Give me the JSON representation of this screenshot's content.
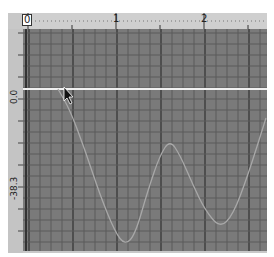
{
  "window": {
    "type": "waveform-plot"
  },
  "top_ruler": {
    "labels": [
      "0",
      "1",
      "2"
    ]
  },
  "left_ruler": {
    "labels": [
      "0.0",
      "-38.3"
    ]
  },
  "colors": {
    "plot_bg": "#7a7a7a",
    "grid_minor": "#5a5a5a",
    "grid_major": "#3c3c3c",
    "waveform": "#a8a8a8",
    "cursor_line": "#f0f0f0",
    "ruler_bg": "#cfcfcf"
  },
  "cursor": {
    "icon": "mouse-pointer-icon"
  },
  "chart_data": {
    "type": "line",
    "title": "",
    "xlabel": "",
    "ylabel": "",
    "x_ticks": [
      0,
      1,
      2
    ],
    "y_ticks": [
      0.0,
      -38.3
    ],
    "xlim": [
      0,
      2.7
    ],
    "ylim": [
      -80,
      30
    ],
    "reference_line_y": 0.0,
    "series": [
      {
        "name": "waveform",
        "x": [
          0.34,
          0.5,
          0.7,
          0.9,
          1.05,
          1.15,
          1.3,
          1.45,
          1.55,
          1.7,
          1.85,
          2.0,
          2.12,
          2.25,
          2.4,
          2.5,
          2.7
        ],
        "y": [
          0.0,
          -10,
          -32,
          -60,
          -74,
          -78,
          -65,
          -40,
          -26,
          -36,
          -55,
          -70,
          -69,
          -60,
          -40,
          -25,
          -14
        ]
      }
    ]
  }
}
